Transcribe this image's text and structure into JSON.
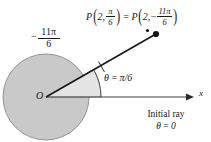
{
  "figure": {
    "colors": {
      "disk_fill": "#c9c9c9",
      "disk_stroke": "#8a8a8a",
      "wedge_fill": "#e2e2e2",
      "wedge_stroke": "#9a9a9a",
      "ray": "#1a1a1a",
      "axis": "#3a3a3a",
      "text": "#1a1a1a",
      "background": "#ffffff"
    }
  },
  "point_label": {
    "p_left": "P",
    "open_paren": "(",
    "radius_left": "2",
    "comma": ",",
    "angle_left": {
      "numerator": "π",
      "denominator": "6"
    },
    "close_paren": ")",
    "equals": "=",
    "p_right": "P",
    "radius_right": "2",
    "minus": "−",
    "angle_right": {
      "numerator": "11π",
      "denominator": "6"
    }
  },
  "sweep_label": {
    "minus": "−",
    "numerator": "11π",
    "denominator": "6"
  },
  "theta_label": {
    "theta": "θ",
    "equals": "=",
    "value": "π/6"
  },
  "origin": {
    "label": "O"
  },
  "axis": {
    "x_label": "x"
  },
  "initial_ray": {
    "line1": "Initial ray",
    "theta": "θ",
    "equals": "=",
    "value": "0"
  },
  "geometry": {
    "origin_x": 46,
    "origin_y": 97,
    "disk_radius": 43,
    "wedge_radius": 55,
    "terminal_angle_deg": 30,
    "point_p_x": 157,
    "point_p_y": 35,
    "axis_end_x": 191
  }
}
